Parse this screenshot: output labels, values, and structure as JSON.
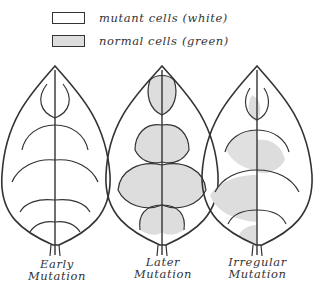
{
  "legend": {
    "items": [
      {
        "label": "mutant cells (white)",
        "fill": "#ffffff"
      },
      {
        "label": "normal cells (green)",
        "fill": "#dddddd"
      }
    ]
  },
  "leaves": [
    {
      "name": "early",
      "caption_line1": "Early",
      "caption_line2": "Mutation"
    },
    {
      "name": "later",
      "caption_line1": "Later",
      "caption_line2": "Mutation"
    },
    {
      "name": "irregular",
      "caption_line1": "Irregular",
      "caption_line2": "Mutation"
    }
  ],
  "colors": {
    "outline": "#333333",
    "normal_fill": "#dddddd",
    "mutant_fill": "#ffffff"
  }
}
